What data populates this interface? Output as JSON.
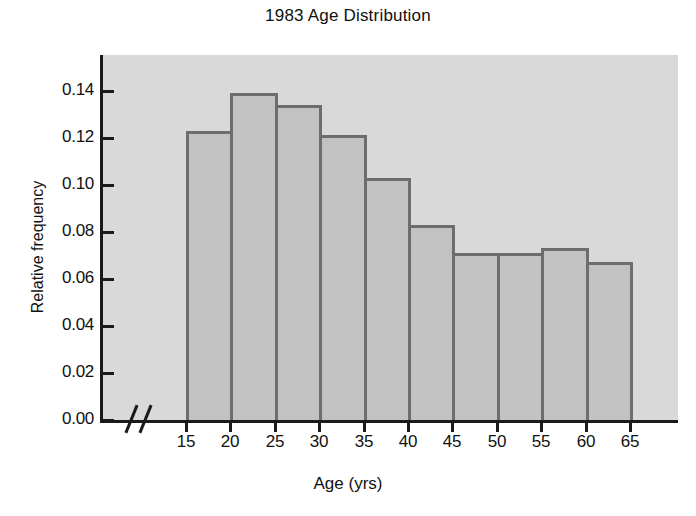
{
  "chart_data": {
    "type": "bar",
    "title": "1983 Age Distribution",
    "xlabel": "Age (yrs)",
    "ylabel": "Relative frequency",
    "categories": [
      "15-20",
      "20-25",
      "25-30",
      "30-35",
      "35-40",
      "40-45",
      "45-50",
      "50-55",
      "55-60",
      "60-65"
    ],
    "bin_edges": [
      15,
      20,
      25,
      30,
      35,
      40,
      45,
      50,
      55,
      60,
      65
    ],
    "values": [
      0.123,
      0.139,
      0.134,
      0.121,
      0.103,
      0.083,
      0.071,
      0.071,
      0.073,
      0.067
    ],
    "x": [
      15,
      20,
      25,
      30,
      35,
      40,
      45,
      50,
      55,
      60,
      65
    ],
    "xtick_labels": [
      "15",
      "20",
      "25",
      "30",
      "35",
      "40",
      "45",
      "50",
      "55",
      "60",
      "65"
    ],
    "ytick_values": [
      0.0,
      0.02,
      0.04,
      0.06,
      0.08,
      0.1,
      0.12,
      0.14
    ],
    "ytick_labels": [
      "0.00",
      "0.02",
      "0.04",
      "0.06",
      "0.08",
      "0.10",
      "0.12",
      "0.14"
    ],
    "ylim": [
      0.0,
      0.1552
    ],
    "xlim": [
      15,
      65
    ],
    "grid": false,
    "legend": null,
    "axis_break": "//",
    "colors": {
      "bar_fill": "#c2c2c2",
      "bar_edge": "#6d6d6d",
      "plot_background": "#d9d9d9",
      "axis": "#1a1a1a",
      "text": "#111111",
      "page_background": "#ffffff"
    }
  }
}
